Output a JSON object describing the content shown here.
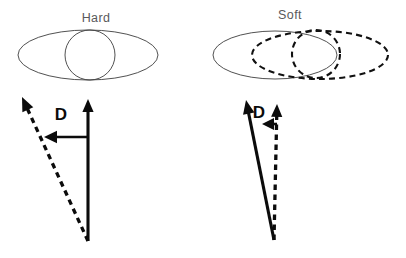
{
  "figure": {
    "name": "hard-vs-soft-vector-diagram",
    "background_color": "#ffffff",
    "width": 406,
    "height": 258,
    "ink_color": "#0b0b0b",
    "outline_color": "#3d3d3d",
    "title_color": "#59595b"
  },
  "panels": [
    {
      "id": "hard",
      "title": "Hard",
      "title_x": 96,
      "title_y": 22,
      "shapes": [
        {
          "kind": "ellipse",
          "name": "hard-outer-ellipse",
          "style": "solid",
          "cx": 88,
          "cy": 55,
          "rx": 70,
          "ry": 25
        },
        {
          "kind": "circle",
          "name": "hard-inner-circle",
          "style": "solid",
          "cx": 90,
          "cy": 55,
          "r": 25
        }
      ],
      "vectors": [
        {
          "name": "hard-solid-vector",
          "style": "solid",
          "x1": 88,
          "y1": 241,
          "x2": 88,
          "y2": 99
        },
        {
          "name": "hard-dashed-vector",
          "style": "dashed",
          "x1": 88,
          "y1": 241,
          "x2": 22,
          "y2": 97
        }
      ],
      "measure": {
        "name": "hard-d-measure-arrow",
        "label": "D",
        "label_x": 61,
        "label_y": 120,
        "from_x": 88,
        "from_y": 137,
        "to_x": 44,
        "to_y": 137
      }
    },
    {
      "id": "soft",
      "title": "Soft",
      "title_x": 290,
      "title_y": 19,
      "shapes": [
        {
          "kind": "ellipse",
          "name": "soft-outer-ellipse",
          "style": "solid",
          "cx": 275,
          "cy": 55,
          "rx": 62,
          "ry": 24
        },
        {
          "kind": "ellipse",
          "name": "soft-shifted-dashed-ellipse",
          "style": "dashed",
          "cx": 320,
          "cy": 55,
          "rx": 68,
          "ry": 24
        },
        {
          "kind": "circle",
          "name": "soft-dashed-circle",
          "style": "dashed",
          "cx": 316,
          "cy": 54,
          "r": 24
        }
      ],
      "vectors": [
        {
          "name": "soft-dashed-vector",
          "style": "dashed",
          "x1": 274,
          "y1": 240,
          "x2": 277,
          "y2": 104
        },
        {
          "name": "soft-solid-vector",
          "style": "solid",
          "x1": 274,
          "y1": 240,
          "x2": 246,
          "y2": 100
        }
      ],
      "measure": {
        "name": "soft-d-measure-arrow",
        "label": "D",
        "label_x": 259,
        "label_y": 118,
        "from_x": 277,
        "from_y": 124,
        "to_x": 262,
        "to_y": 124
      }
    }
  ]
}
